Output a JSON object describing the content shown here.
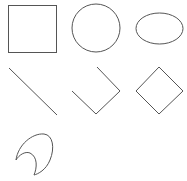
{
  "canvas": {
    "width": 187,
    "height": 181,
    "background": "#ffffff",
    "stroke_color": "#555555"
  },
  "shapes": [
    {
      "name": "square",
      "type": "rect",
      "x": 8.5,
      "y": 5.5,
      "width": 48,
      "height": 47
    },
    {
      "name": "circle",
      "type": "circle",
      "cx": 96,
      "cy": 28,
      "r": 24
    },
    {
      "name": "ellipse",
      "type": "ellipse",
      "cx": 159.5,
      "cy": 28.5,
      "rx": 23.5,
      "ry": 15.5
    },
    {
      "name": "diagonal-line",
      "type": "line",
      "x1": 9,
      "y1": 68,
      "x2": 57,
      "y2": 115
    },
    {
      "name": "open-polyline",
      "type": "polyline",
      "points": "97,67 120,91 96,114 72,91"
    },
    {
      "name": "diamond",
      "type": "polygon",
      "points": "159,67 183,91 159,114 136,91"
    },
    {
      "name": "crescent",
      "type": "path",
      "d": "M16,160 C18,145 32,133 44,134 C53,135 55,148 50,160 C46,170 38,174 34,175 C37,168 38,157 30,153 C25,151 19,155 16,160 Z"
    }
  ]
}
